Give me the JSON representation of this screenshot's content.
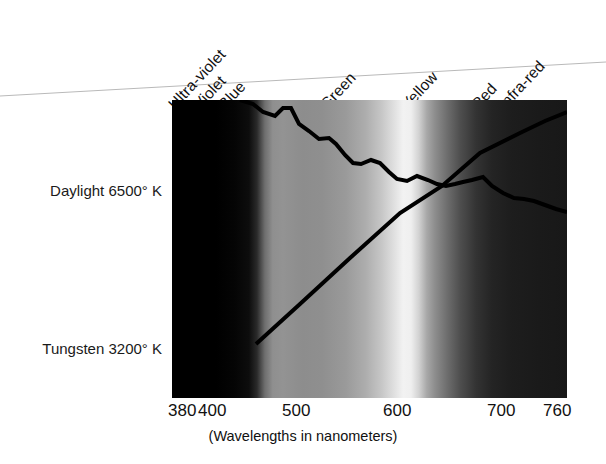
{
  "figure": {
    "axis_caption": "(Wavelengths in nanometers)",
    "band_labels": [
      {
        "name": "ultra-violet",
        "text": "Ultra-violet",
        "x": 178,
        "y": 95
      },
      {
        "name": "violet",
        "text": "Violet",
        "x": 203,
        "y": 95
      },
      {
        "name": "blue",
        "text": "Blue",
        "x": 228,
        "y": 95
      },
      {
        "name": "green",
        "text": "Green",
        "x": 330,
        "y": 95
      },
      {
        "name": "yellow",
        "text": "Yellow",
        "x": 411,
        "y": 95
      },
      {
        "name": "red",
        "text": "Red",
        "x": 481,
        "y": 95
      },
      {
        "name": "infra-red",
        "text": "Infra-red",
        "x": 508,
        "y": 95
      }
    ],
    "row_labels": [
      {
        "name": "daylight",
        "text": "Daylight 6500° K",
        "y": 190
      },
      {
        "name": "tungsten",
        "text": "Tungsten 3200° K",
        "y": 348
      }
    ]
  },
  "chart_data": {
    "type": "line",
    "title": "",
    "subtitle": "",
    "xlabel": "(Wavelengths in nanometers)",
    "ylabel": "",
    "xlim": [
      380,
      760
    ],
    "grid": false,
    "legend_position": "left-of-plot",
    "tick_labels": [
      "380",
      "400",
      "500",
      "600",
      "700",
      "760"
    ],
    "tick_values": [
      380,
      400,
      500,
      600,
      700,
      760
    ],
    "tick_px_x": [
      168,
      198,
      282,
      383,
      487,
      543
    ],
    "annotations": [
      "Ultra-violet",
      "Violet",
      "Blue",
      "Green",
      "Yellow",
      "Red",
      "Infra-red"
    ],
    "background": "visible-spectrum-grayscale-gradient",
    "series": [
      {
        "name": "Daylight 6500° K",
        "label_x": 40,
        "label_y": 190,
        "color": "#000000",
        "points_px": [
          [
            240,
            100
          ],
          [
            253,
            104
          ],
          [
            263,
            112
          ],
          [
            275,
            116
          ],
          [
            283,
            108
          ],
          [
            291,
            108
          ],
          [
            299,
            124
          ],
          [
            309,
            131
          ],
          [
            319,
            139
          ],
          [
            329,
            138
          ],
          [
            336,
            144
          ],
          [
            345,
            155
          ],
          [
            353,
            163
          ],
          [
            361,
            164
          ],
          [
            371,
            160
          ],
          [
            380,
            163
          ],
          [
            389,
            172
          ],
          [
            397,
            179
          ],
          [
            407,
            181
          ],
          [
            417,
            176
          ],
          [
            428,
            180
          ],
          [
            437,
            184
          ],
          [
            446,
            186
          ],
          [
            455,
            184
          ],
          [
            463,
            182
          ],
          [
            472,
            180
          ],
          [
            483,
            177
          ],
          [
            492,
            186
          ],
          [
            503,
            193
          ],
          [
            514,
            198
          ],
          [
            524,
            199
          ],
          [
            534,
            201
          ],
          [
            545,
            205
          ],
          [
            556,
            209
          ],
          [
            567,
            212
          ]
        ],
        "wavelengths_nm": [
          438,
          443,
          448,
          453,
          456,
          460,
          463,
          467,
          471,
          475,
          478,
          481,
          484,
          488,
          492,
          495,
          499,
          502,
          506,
          510,
          514,
          517,
          520,
          524,
          527,
          531,
          535,
          538,
          542,
          546,
          550,
          554,
          558,
          562,
          566
        ],
        "relative_energy": [
          100,
          96,
          89,
          85,
          92,
          92,
          78,
          72,
          65,
          66,
          61,
          52,
          45,
          44,
          48,
          45,
          37,
          31,
          30,
          34,
          31,
          27,
          25,
          27,
          29,
          30,
          33,
          25,
          19,
          15,
          14,
          12,
          9,
          6,
          4
        ]
      },
      {
        "name": "Tungsten 3200° K",
        "label_x": 40,
        "label_y": 348,
        "color": "#000000",
        "points_px": [
          [
            256,
            344
          ],
          [
            300,
            304
          ],
          [
            350,
            258
          ],
          [
            400,
            213
          ],
          [
            442,
            186
          ],
          [
            480,
            153
          ],
          [
            520,
            133
          ],
          [
            545,
            121
          ],
          [
            567,
            112
          ]
        ],
        "wavelengths_nm": [
          458,
          500,
          548,
          596,
          636,
          673,
          711,
          735,
          760
        ],
        "relative_energy": [
          4,
          17,
          33,
          49,
          60,
          72,
          80,
          85,
          89
        ]
      }
    ]
  }
}
